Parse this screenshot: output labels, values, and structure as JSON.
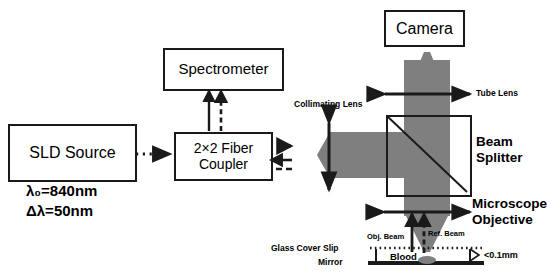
{
  "diagram": {
    "colors": {
      "beam_gray": "#7f7f7f",
      "stroke": "#1a1a1a",
      "background": "#ffffff"
    },
    "components": [
      {
        "id": "sld_source",
        "label": "SLD Source",
        "type": "box"
      },
      {
        "id": "spectrometer",
        "label": "Spectrometer",
        "type": "box"
      },
      {
        "id": "fiber_coupler",
        "label": "2×2 Fiber\nCoupler",
        "type": "box"
      },
      {
        "id": "camera",
        "label": "Camera",
        "type": "box"
      },
      {
        "id": "beam_splitter",
        "label": "Beam\nSplitter",
        "type": "square-diagonal"
      }
    ],
    "optics_labels": [
      {
        "id": "collimating_lens",
        "label": "Collimating Lens"
      },
      {
        "id": "tube_lens",
        "label": "Tube Lens"
      },
      {
        "id": "beam_splitter_label",
        "label": "Beam\nSplitter"
      },
      {
        "id": "microscope_objective",
        "label": "Microscope\nObjective"
      }
    ],
    "source_params": {
      "center_wavelength": "λ₀=840nm",
      "bandwidth": "Δλ=50nm"
    },
    "sample_labels": {
      "obj_beam": "Obj. Beam",
      "ref_beam": "Ref. Beam",
      "glass_cover_slip": "Glass Cover Slip",
      "mirror": "Mirror",
      "blood": "Blood",
      "thickness": "<0.1mm"
    }
  }
}
